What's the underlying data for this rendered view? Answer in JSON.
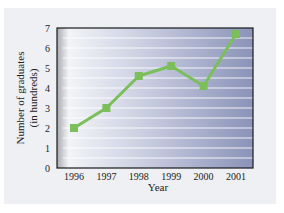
{
  "chart_data": {
    "type": "line",
    "title": "",
    "xlabel": "Year",
    "ylabel": "Number of graduates (in hundreds)",
    "ylabel_lines": [
      "Number of graduates",
      "(in hundreds)"
    ],
    "categories": [
      "1996",
      "1997",
      "1998",
      "1999",
      "2000",
      "2001"
    ],
    "series": [
      {
        "name": "Graduates",
        "values": [
          2.0,
          3.0,
          4.6,
          5.1,
          4.1,
          6.7
        ],
        "color": "#7bbf5a"
      }
    ],
    "yticks": [
      "0",
      "1",
      "2",
      "3",
      "4",
      "5",
      "6",
      "7"
    ],
    "ylim": [
      0,
      7
    ],
    "grid": true,
    "legend": "none"
  },
  "colors": {
    "line": "#7bbf5a",
    "plot_bg_left": "#f4f5f8",
    "plot_bg_right": "#8a93b8",
    "gridline": "#ffffff",
    "axis": "#1a1a1a"
  }
}
